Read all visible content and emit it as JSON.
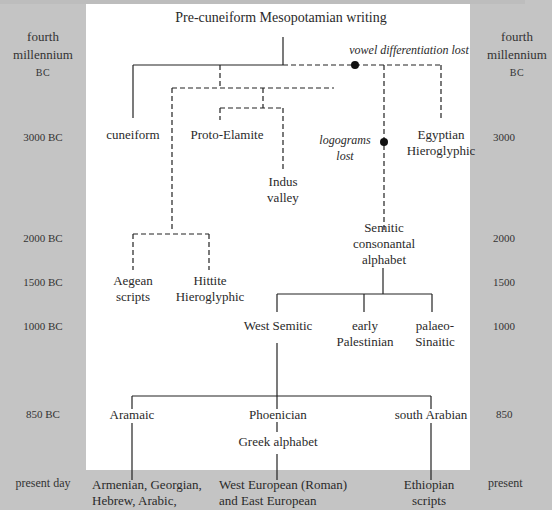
{
  "title": "Pre-cuneiform Mesopotamian writing",
  "timeline_left": [
    {
      "line1": "fourth",
      "line2": "millennium",
      "line3": "BC"
    },
    {
      "label": "3000 BC"
    },
    {
      "label": "2000 BC"
    },
    {
      "label": "1500 BC"
    },
    {
      "label": "1000 BC"
    },
    {
      "label": "850 BC"
    },
    {
      "label": "present day"
    }
  ],
  "timeline_right": [
    {
      "line1": "fourth",
      "line2": "millennium",
      "line3": "BC"
    },
    {
      "label": "3000"
    },
    {
      "label": "2000"
    },
    {
      "label": "1500"
    },
    {
      "label": "1000"
    },
    {
      "label": "850"
    },
    {
      "label": "present"
    }
  ],
  "annotations": {
    "vowel": "vowel differentiation lost",
    "logograms_1": "logograms",
    "logograms_2": "lost"
  },
  "nodes": {
    "cuneiform": "cuneiform",
    "proto_elamite": "Proto-Elamite",
    "indus_1": "Indus",
    "indus_2": "valley",
    "egyptian_1": "Egyptian",
    "egyptian_2": "Hieroglyphic",
    "semitic_1": "Semitic",
    "semitic_2": "consonantal",
    "semitic_3": "alphabet",
    "aegean_1": "Aegean",
    "aegean_2": "scripts",
    "hittite_1": "Hittite",
    "hittite_2": "Hieroglyphic",
    "west_semitic": "West Semitic",
    "early_pal_1": "early",
    "early_pal_2": "Palestinian",
    "palaeo_1": "palaeo-",
    "palaeo_2": "Sinaitic",
    "aramaic": "Aramaic",
    "phoenician": "Phoenician",
    "south_arabian": "south Arabian",
    "greek": "Greek alphabet",
    "armenian_1": "Armenian, Georgian,",
    "armenian_2": "Hebrew, Arabic,",
    "west_euro_1": "West European (Roman)",
    "west_euro_2": "and East European",
    "ethiopian_1": "Ethiopian",
    "ethiopian_2": "scripts"
  },
  "colors": {
    "background": "#c4c4c4",
    "panel": "#ffffff",
    "line": "#222222"
  }
}
